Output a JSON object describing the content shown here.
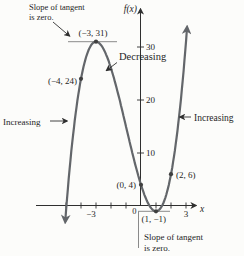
{
  "figure": {
    "background": "#fcfcfa",
    "origin_label": "0"
  },
  "chart_data": {
    "type": "line",
    "title": "",
    "xlabel": "x",
    "ylabel": "f(x)",
    "function": {
      "expression": "f(x) = x^3 + 3x^2 - 9x + 4",
      "coefficients": [
        1,
        3,
        -9,
        4
      ],
      "domain": [
        -5.05,
        3.07
      ]
    },
    "xlim": [
      -7,
      4
    ],
    "ylim": [
      -9,
      38
    ],
    "grid": false,
    "x_ticks": [
      -5,
      -4,
      -3,
      -2,
      -1,
      1,
      2,
      3
    ],
    "y_ticks": [
      10,
      20,
      30
    ],
    "x_tick_labels": [
      {
        "value": -3,
        "label": "−3",
        "dx": -5
      },
      {
        "value": 3,
        "label": "3",
        "dx": 0
      }
    ],
    "points": [
      {
        "x": -4,
        "y": 24,
        "label": "(−4, 24)"
      },
      {
        "x": -3,
        "y": 31,
        "label": "(−3, 31)"
      },
      {
        "x": 0,
        "y": 4,
        "label": "(0, 4)"
      },
      {
        "x": 2,
        "y": 6,
        "label": "(2, 6)"
      },
      {
        "x": 1,
        "y": -1,
        "label": "(1, −1)"
      }
    ],
    "critical_points": [
      {
        "x": -3,
        "y": 31,
        "type": "local maximum, slope of tangent is zero"
      },
      {
        "x": 1,
        "y": -1,
        "type": "local minimum, slope of tangent is zero"
      }
    ],
    "annotations": {
      "tangent_top_line1": "Slope of tangent",
      "tangent_top_line2": "is zero.",
      "tangent_bottom_line1": "Slope of tangent",
      "tangent_bottom_line2": "is zero.",
      "decreasing": "Decreasing",
      "increasing_left": "Increasing",
      "increasing_right": "Increasing"
    },
    "colors": {
      "curve": "#63666a",
      "axis": "#2f2f2f",
      "text": "#1f1f1f",
      "tangent_line": "#8a8a8a",
      "point": "#3f3f3f",
      "background": "#fcfcfa"
    }
  }
}
